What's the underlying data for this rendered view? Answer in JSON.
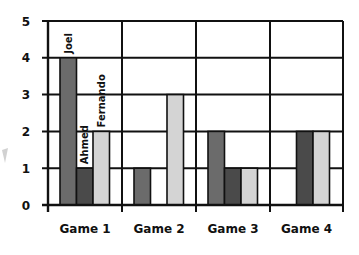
{
  "chart_data": {
    "type": "bar",
    "title": "",
    "xlabel": "",
    "ylabel": "",
    "categories": [
      "Game 1",
      "Game 2",
      "Game 3",
      "Game 4"
    ],
    "series": [
      {
        "name": "Joel",
        "color": "#6b6b6b",
        "values": [
          4,
          1,
          2,
          0
        ]
      },
      {
        "name": "Ahmed",
        "color": "#4a4a4a",
        "values": [
          1,
          0,
          1,
          2
        ]
      },
      {
        "name": "Fernando",
        "color": "#d4d4d4",
        "values": [
          2,
          3,
          1,
          2
        ]
      }
    ],
    "ylim": [
      0,
      5
    ],
    "yticks": [
      0,
      1,
      2,
      3,
      4,
      5
    ],
    "grid": true,
    "legend": "inline rotated labels above Game 1 bars"
  },
  "layout": {
    "plot_left": 48,
    "plot_right": 343,
    "plot_top": 21,
    "plot_bottom": 205,
    "group_bounds": [
      48,
      122,
      196,
      270,
      343
    ],
    "bar_width": 16.5,
    "group_bar_start": [
      60,
      134,
      208,
      280
    ],
    "axis_color": "#111111"
  }
}
